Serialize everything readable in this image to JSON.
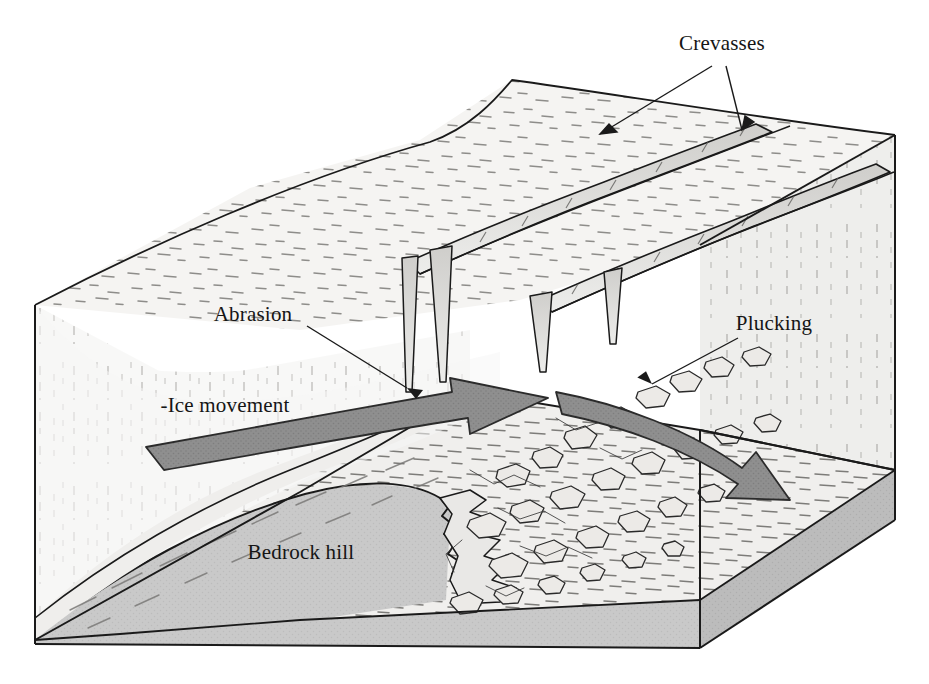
{
  "figure": {
    "background_color": "#ffffff",
    "outline_color": "#1a1a1a"
  },
  "labels": [
    {
      "id": "crevasses",
      "text": "Crevasses",
      "x": 722,
      "y": 50,
      "anchor": "middle",
      "leader_count": 2
    },
    {
      "id": "abrasion",
      "text": "Abrasion",
      "x": 253,
      "y": 321,
      "anchor": "middle",
      "leader_count": 1
    },
    {
      "id": "ice-movement",
      "text": "-Ice movement",
      "x": 225,
      "y": 412,
      "anchor": "middle",
      "leader_count": 0
    },
    {
      "id": "plucking",
      "text": "Plucking",
      "x": 774,
      "y": 330,
      "anchor": "middle",
      "leader_count": 1
    },
    {
      "id": "bedrock-hill",
      "text": "Bedrock hill",
      "x": 301,
      "y": 559,
      "anchor": "middle",
      "leader_count": 0
    }
  ],
  "colors": {
    "ice_surface": "#f4f3f1",
    "ice_left_face": "#f7f7f6",
    "ice_right_face": "#ececea",
    "bedrock_fill": "#c9c9c9",
    "bedrock_right_face": "#bdbdbd",
    "bedrock_front_face": "#c4c4c4",
    "glacier_sole": "#efeeec",
    "arrow_fill": "#8d8d8d",
    "arrow_stroke": "#2b2b2b",
    "crevasse_shadow": "#d6d5d3",
    "outline": "#1a1a1a",
    "hatch": "#6b6b6b",
    "label_text": "#151515"
  },
  "features": {
    "crevasse_count": 2,
    "crevasse_wedges": 3,
    "ice_flow_arrows": 2,
    "arrow_notes": [
      "upper-left arrow sweeps up-glacier toward the stoss slope",
      "lower-right arrow curves down over the lee side toward the plucked debris"
    ],
    "bedrock_hill": "asymmetric: smooth abraded stoss side on the left, jagged plucked lee side on the right",
    "debris_field": "angular plucked rock fragments scattered down-glacier of the bedrock hill"
  }
}
